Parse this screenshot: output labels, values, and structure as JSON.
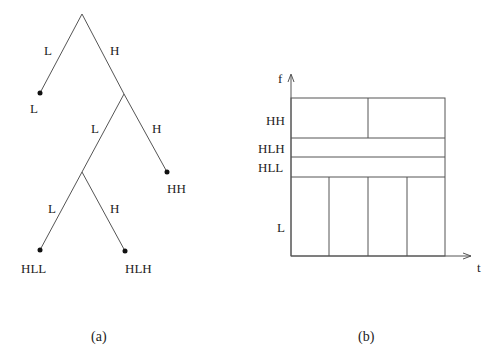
{
  "figure_a": {
    "caption": "(a)",
    "root_edges": {
      "left": "L",
      "right": "H"
    },
    "leaf_L": "L",
    "node_H_edges": {
      "left": "L",
      "right": "H"
    },
    "leaf_HH": "HH",
    "node_HL_edges": {
      "left": "L",
      "right": "H"
    },
    "leaf_HLL": "HLL",
    "leaf_HLH": "HLH"
  },
  "figure_b": {
    "caption": "(b)",
    "y_axis_label": "f",
    "x_axis_label": "t",
    "bands": [
      {
        "label": "HH",
        "divisions": 2
      },
      {
        "label": "HLH",
        "divisions": 1
      },
      {
        "label": "HLL",
        "divisions": 1
      },
      {
        "label": "L",
        "divisions": 4
      }
    ]
  }
}
